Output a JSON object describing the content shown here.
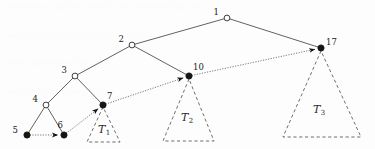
{
  "figure": {
    "background_color": "#fdfdfd",
    "width": 375,
    "height": 149
  },
  "chart_data": {
    "type": "diagram",
    "title": "",
    "xlabel": "",
    "ylabel": "",
    "nodes": [
      {
        "id": "n1",
        "label": "1",
        "x": 227,
        "y": 18,
        "style": "open",
        "label_dx": -8,
        "label_dy": -3
      },
      {
        "id": "n2",
        "label": "2",
        "x": 132,
        "y": 45,
        "style": "open",
        "label_dx": -8,
        "label_dy": -3
      },
      {
        "id": "n3",
        "label": "3",
        "x": 75,
        "y": 76,
        "style": "open",
        "label_dx": -8,
        "label_dy": -3
      },
      {
        "id": "n4",
        "label": "4",
        "x": 46,
        "y": 105,
        "style": "open",
        "label_dx": -8,
        "label_dy": -3
      },
      {
        "id": "n5",
        "label": "5",
        "x": 27,
        "y": 135,
        "style": "filled",
        "label_dx": -9,
        "label_dy": -2
      },
      {
        "id": "n6",
        "label": "6",
        "x": 64,
        "y": 135,
        "style": "filled",
        "label_dx": -1,
        "label_dy": -7
      },
      {
        "id": "n7",
        "label": "7",
        "x": 103,
        "y": 105,
        "style": "filled",
        "label_dx": 4,
        "label_dy": -6
      },
      {
        "id": "n10",
        "label": "10",
        "x": 189,
        "y": 76,
        "style": "filled",
        "label_dx": 4,
        "label_dy": -6
      },
      {
        "id": "n17",
        "label": "17",
        "x": 321,
        "y": 48,
        "style": "filled",
        "label_dx": 5,
        "label_dy": -3
      }
    ],
    "edges": [
      {
        "from": "n1",
        "to": "n2",
        "kind": "solid"
      },
      {
        "from": "n1",
        "to": "n17",
        "kind": "solid"
      },
      {
        "from": "n2",
        "to": "n3",
        "kind": "solid"
      },
      {
        "from": "n2",
        "to": "n10",
        "kind": "solid"
      },
      {
        "from": "n3",
        "to": "n4",
        "kind": "solid"
      },
      {
        "from": "n3",
        "to": "n7",
        "kind": "solid"
      },
      {
        "from": "n4",
        "to": "n5",
        "kind": "solid"
      },
      {
        "from": "n4",
        "to": "n6",
        "kind": "solid"
      }
    ],
    "path": {
      "kind": "dotted-arrow",
      "sequence": [
        "n5",
        "n6",
        "n7",
        "n10",
        "n17"
      ],
      "segments": [
        {
          "from": "n5",
          "to": "n6",
          "arrow_at_end": true
        },
        {
          "from": "n6",
          "to": "n7",
          "arrow_at_end": true
        },
        {
          "from": "n7",
          "to": "n10",
          "arrow_at_end": true
        },
        {
          "from": "n10",
          "to": "n17",
          "arrow_at_end": true
        }
      ]
    },
    "subtrees": [
      {
        "id": "T1",
        "label": "T",
        "sub": "1",
        "apex_node": "n7",
        "apex_x": 103,
        "apex_y": 107,
        "base_left_x": 87,
        "base_right_x": 120,
        "base_y": 142,
        "label_x": 104,
        "label_y": 133
      },
      {
        "id": "T2",
        "label": "T",
        "sub": "2",
        "apex_node": "n10",
        "apex_x": 189,
        "apex_y": 79,
        "base_left_x": 163,
        "base_right_x": 214,
        "base_y": 141,
        "label_x": 187,
        "label_y": 121
      },
      {
        "id": "T3",
        "label": "T",
        "sub": "3",
        "apex_node": "n17",
        "apex_x": 321,
        "apex_y": 51,
        "base_left_x": 283,
        "base_right_x": 361,
        "base_y": 137,
        "label_x": 319,
        "label_y": 113
      }
    ],
    "legend": [],
    "colors": {
      "edge": "#3a3a3a",
      "path": "#6a6a6a",
      "triangle": "#4a4a4a",
      "node_open_fill": "#ffffff",
      "node_filled_fill": "#151515",
      "text": "#1a1a1a",
      "background": "#fdfdfd"
    }
  },
  "artifacts": {
    "note": "faint scanned page bleed-through in background",
    "lines": [
      {
        "text": "the shape of the tree is not affected by the",
        "x": 8,
        "y": 6
      },
      {
        "text": "search operation and the nodes",
        "x": 8,
        "y": 34
      },
      {
        "text": "the path from the root",
        "x": 8,
        "y": 62
      },
      {
        "text": "subtrees hanging off",
        "x": 8,
        "y": 90
      }
    ]
  }
}
